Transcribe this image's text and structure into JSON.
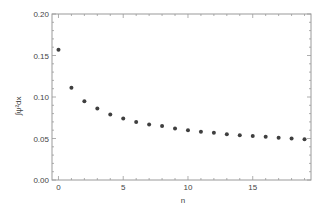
{
  "chart_data": {
    "type": "scatter",
    "title": "",
    "xlabel": "n",
    "ylabel": "∫ψ²dx",
    "xlim": [
      -0.5,
      19.5
    ],
    "ylim": [
      0.0,
      0.2
    ],
    "x_ticks": [
      0,
      5,
      10,
      15
    ],
    "x_tick_labels": [
      "0",
      "5",
      "10",
      "15"
    ],
    "x_minor_step": 1,
    "y_ticks": [
      0.0,
      0.05,
      0.1,
      0.15,
      0.2
    ],
    "y_tick_labels": [
      "0.00",
      "0.05",
      "0.10",
      "0.15",
      "0.20"
    ],
    "y_minor_step": 0.01,
    "grid": false,
    "frame": true,
    "legend": null,
    "series": [
      {
        "name": "∫ψ²dx",
        "color": "#3f3f3f",
        "x": [
          0,
          1,
          2,
          3,
          4,
          5,
          6,
          7,
          8,
          9,
          10,
          11,
          12,
          13,
          14,
          15,
          16,
          17,
          18,
          19
        ],
        "values": [
          0.157,
          0.111,
          0.095,
          0.086,
          0.079,
          0.074,
          0.07,
          0.067,
          0.065,
          0.062,
          0.06,
          0.058,
          0.057,
          0.055,
          0.054,
          0.053,
          0.052,
          0.051,
          0.05,
          0.049
        ]
      }
    ]
  },
  "colors": {
    "frame": "#9a9a9a",
    "text": "#444444",
    "points": "#3f3f3f",
    "background": "#ffffff"
  }
}
